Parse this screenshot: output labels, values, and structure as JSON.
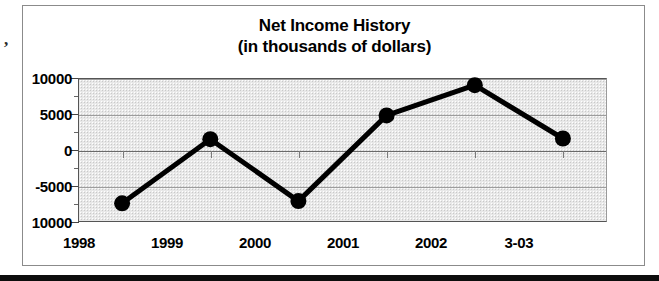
{
  "artifact": {
    "mark": ","
  },
  "chart_data": {
    "type": "line",
    "title": "Net Income History",
    "subtitle": "(in thousands of dollars)",
    "xlabel": "",
    "ylabel": "",
    "categories": [
      "1998",
      "1999",
      "2000",
      "2001",
      "2002",
      "3-03"
    ],
    "values": [
      -7400,
      1500,
      -7100,
      4800,
      9000,
      1600
    ],
    "series": [
      {
        "name": "Net Income",
        "values": [
          -7400,
          1500,
          -7100,
          4800,
          9000,
          1600
        ]
      }
    ],
    "ylim": [
      -10000,
      10000
    ],
    "ytick_labels": [
      "10000",
      "5000",
      "0",
      "-5000",
      "10000"
    ],
    "ytick_values": [
      10000,
      5000,
      0,
      -5000,
      -10000
    ],
    "yminor_values": [
      7500,
      2500,
      -2500,
      -7500
    ],
    "grid": true,
    "legend": false,
    "legend_position": "none",
    "marker": "filled-circle",
    "line_color": "#000000",
    "marker_color": "#000000",
    "plot_background": "#e8e8e8"
  }
}
